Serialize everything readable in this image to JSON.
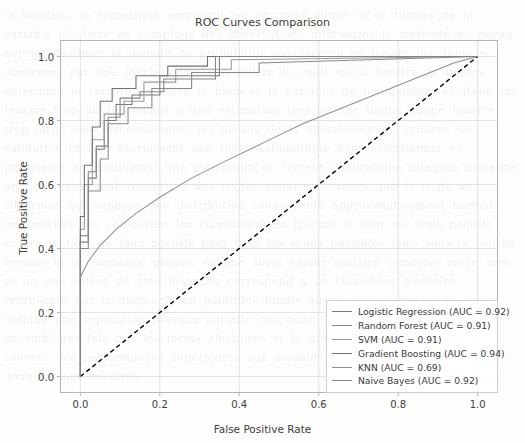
{
  "watermark_text": "la fonction de repartition empirique en un point donne la en termes de la variable aleatoire de comptage des observations inferieures la methode du noyau permet destimer la densite de probabilite sous-jacente en lissant les donnees observees par une fonction noyau reguliere le choix de la fenetre de lissage determine le compromis entre le biais et la variance de lestimateur resultant une fenetre trop petite conduit a une estimation tres bruitee tandis quune fenetre trop large lisse excessivement les details de la distribution les criteres de validation croisee fournissent une regle automatique pour selectionner ce parametre en minimisant une estimation de lerreur quadratique integree moyenne on peut egalement recourir a des regles empiriques telles que la regle de silverman qui suppose une distribution sous-jacente approximativement normale les courbes roc comparent les classifieurs en tracant le taux de vrais positifs contre le taux de faux positifs pour tous les seuils possibles laire sous la courbe resume la performance globale en une seule valeur scalaire comprise entre zero et un une valeur de cinq dixiemes correspond a un classifieur aleatoire represente par la diagonale en pointilles tandis quune valeur proche de lunite indique une separation presque parfaite des deux classes les modeles ensemblistes tels que les forets aleatoires et le gradient boosting atteignent souvent des performances superieures aux modeles lineaires simples sur des donnees non lineaires",
  "chart_data": {
    "type": "line",
    "title": "ROC Curves Comparison",
    "xlabel": "False Positive Rate",
    "ylabel": "True Positive Rate",
    "xlim": [
      -0.05,
      1.05
    ],
    "ylim": [
      -0.05,
      1.05
    ],
    "xticks": [
      "0.0",
      "0.2",
      "0.4",
      "0.6",
      "0.8",
      "1.0"
    ],
    "xtick_values": [
      0.0,
      0.2,
      0.4,
      0.6,
      0.8,
      1.0
    ],
    "yticks": [
      "0.0",
      "0.2",
      "0.4",
      "0.6",
      "0.8",
      "1.0"
    ],
    "ytick_values": [
      0.0,
      0.2,
      0.4,
      0.6,
      0.8,
      1.0
    ],
    "grid": true,
    "legend_position": "lower right",
    "chance_line": {
      "name": "chance",
      "x": [
        0.0,
        1.0
      ],
      "y": [
        0.0,
        1.0
      ],
      "style": "dashed",
      "color": "#000000"
    },
    "series": [
      {
        "name": "Logistic Regression",
        "auc": 0.92,
        "legend_label": "Logistic Regression (AUC = 0.92)",
        "color": "#7a7a7a",
        "drawstyle": "steps-post",
        "x": [
          0.0,
          0.0,
          0.02,
          0.02,
          0.04,
          0.04,
          0.06,
          0.06,
          0.09,
          0.09,
          0.13,
          0.13,
          0.2,
          0.2,
          0.35,
          0.35,
          1.0
        ],
        "y": [
          0.0,
          0.44,
          0.44,
          0.62,
          0.62,
          0.71,
          0.71,
          0.8,
          0.8,
          0.85,
          0.85,
          0.88,
          0.88,
          0.94,
          0.94,
          1.0,
          1.0
        ]
      },
      {
        "name": "Random Forest",
        "auc": 0.91,
        "legend_label": "Random Forest (AUC = 0.91)",
        "color": "#8a8a8a",
        "drawstyle": "steps-post",
        "x": [
          0.0,
          0.0,
          0.02,
          0.02,
          0.05,
          0.05,
          0.07,
          0.07,
          0.12,
          0.12,
          0.18,
          0.18,
          0.28,
          0.28,
          0.45,
          0.45,
          1.0
        ],
        "y": [
          0.0,
          0.4,
          0.4,
          0.58,
          0.58,
          0.68,
          0.68,
          0.79,
          0.79,
          0.84,
          0.84,
          0.9,
          0.9,
          0.95,
          0.95,
          0.98,
          1.0
        ]
      },
      {
        "name": "SVM",
        "auc": 0.91,
        "legend_label": "SVM (AUC = 0.91)",
        "color": "#9a9a9a",
        "drawstyle": "steps-post",
        "x": [
          0.0,
          0.0,
          0.01,
          0.01,
          0.03,
          0.03,
          0.06,
          0.06,
          0.11,
          0.11,
          0.16,
          0.16,
          0.24,
          0.24,
          0.38,
          0.38,
          1.0
        ],
        "y": [
          0.0,
          0.46,
          0.46,
          0.6,
          0.6,
          0.74,
          0.74,
          0.82,
          0.82,
          0.86,
          0.86,
          0.92,
          0.92,
          0.96,
          0.96,
          0.99,
          1.0
        ]
      },
      {
        "name": "Gradient Boosting",
        "auc": 0.94,
        "legend_label": "Gradient Boosting (AUC = 0.94)",
        "color": "#707070",
        "drawstyle": "steps-post",
        "x": [
          0.0,
          0.0,
          0.01,
          0.01,
          0.03,
          0.03,
          0.05,
          0.05,
          0.08,
          0.08,
          0.14,
          0.14,
          0.22,
          0.22,
          0.32,
          0.32,
          1.0
        ],
        "y": [
          0.0,
          0.5,
          0.5,
          0.66,
          0.66,
          0.78,
          0.78,
          0.86,
          0.86,
          0.9,
          0.9,
          0.94,
          0.94,
          0.97,
          0.97,
          1.0,
          1.0
        ]
      },
      {
        "name": "KNN",
        "auc": 0.69,
        "legend_label": "KNN (AUC = 0.69)",
        "color": "#909090",
        "drawstyle": "smooth",
        "x": [
          0.0,
          0.02,
          0.05,
          0.09,
          0.14,
          0.2,
          0.28,
          0.36,
          0.46,
          0.56,
          0.66,
          0.76,
          0.86,
          0.94,
          1.0
        ],
        "y": [
          0.31,
          0.36,
          0.41,
          0.46,
          0.51,
          0.56,
          0.62,
          0.67,
          0.73,
          0.79,
          0.84,
          0.89,
          0.94,
          0.98,
          1.0
        ]
      },
      {
        "name": "Naive Bayes",
        "auc": 0.92,
        "legend_label": "Naive Bayes (AUC = 0.92)",
        "color": "#858585",
        "drawstyle": "steps-post",
        "x": [
          0.0,
          0.0,
          0.02,
          0.02,
          0.04,
          0.04,
          0.07,
          0.07,
          0.1,
          0.1,
          0.15,
          0.15,
          0.21,
          0.21,
          0.34,
          0.34,
          1.0
        ],
        "y": [
          0.0,
          0.42,
          0.42,
          0.64,
          0.64,
          0.72,
          0.72,
          0.81,
          0.81,
          0.87,
          0.87,
          0.89,
          0.89,
          0.93,
          0.93,
          1.0,
          1.0
        ]
      }
    ]
  }
}
